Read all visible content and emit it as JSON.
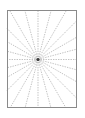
{
  "figure": {
    "type": "radial-line-diagram",
    "canvas": {
      "width": 85,
      "height": 118,
      "background_color": "#ffffff"
    },
    "frame": {
      "name": "bounding-rectangle",
      "x": 7,
      "y": 10,
      "width": 70,
      "height": 98,
      "stroke_color": "#8a8a8a",
      "stroke_width": 1,
      "fill": "none"
    },
    "hub": {
      "name": "convergence-point",
      "x": 38,
      "y": 59.5,
      "radius": 1.6,
      "color": "#3a3a3a",
      "label": "center"
    },
    "rays": {
      "count": 24,
      "angle_step_degrees": 15,
      "start_angle_degrees": 0,
      "stroke_color": "#9a9a9a",
      "stroke_width": 0.6,
      "dash_pattern": "1.4 1.1",
      "origin_x": 38,
      "origin_y": 59.5,
      "angles_degrees": [
        0,
        15,
        30,
        45,
        60,
        75,
        90,
        105,
        120,
        135,
        150,
        165,
        180,
        195,
        210,
        225,
        240,
        255,
        270,
        285,
        300,
        315,
        330,
        345
      ]
    }
  },
  "chart_data": {
    "type": "line",
    "subtitle": "",
    "xlabel": "",
    "ylabel": "",
    "grid": false,
    "legend": "none",
    "xlim": [
      7,
      77
    ],
    "ylim": [
      10,
      108
    ],
    "annotations": [],
    "series": [
      {
        "name": "ray-000",
        "angle_deg": 0,
        "x": [
          38,
          77.0
        ],
        "y": [
          59.5,
          59.5
        ]
      },
      {
        "name": "ray-015",
        "angle_deg": 15,
        "x": [
          38,
          77.0
        ],
        "y": [
          59.5,
          49.05
        ]
      },
      {
        "name": "ray-030",
        "angle_deg": 30,
        "x": [
          38,
          77.0
        ],
        "y": [
          59.5,
          36.98
        ]
      },
      {
        "name": "ray-045",
        "angle_deg": 45,
        "x": [
          38,
          77.0
        ],
        "y": [
          59.5,
          20.5
        ]
      },
      {
        "name": "ray-060",
        "angle_deg": 60,
        "x": [
          38,
          66.62
        ],
        "y": [
          59.5,
          10.0
        ]
      },
      {
        "name": "ray-075",
        "angle_deg": 75,
        "x": [
          38,
          51.28
        ],
        "y": [
          59.5,
          10.0
        ]
      },
      {
        "name": "ray-090",
        "angle_deg": 90,
        "x": [
          38,
          38.0
        ],
        "y": [
          59.5,
          10.0
        ]
      },
      {
        "name": "ray-105",
        "angle_deg": 105,
        "x": [
          38,
          24.72
        ],
        "y": [
          59.5,
          10.0
        ]
      },
      {
        "name": "ray-120",
        "angle_deg": 120,
        "x": [
          38,
          9.38
        ],
        "y": [
          59.5,
          10.0
        ]
      },
      {
        "name": "ray-135",
        "angle_deg": 135,
        "x": [
          38,
          7.0
        ],
        "y": [
          59.5,
          28.5
        ]
      },
      {
        "name": "ray-150",
        "angle_deg": 150,
        "x": [
          38,
          7.0
        ],
        "y": [
          59.5,
          41.6
        ]
      },
      {
        "name": "ray-165",
        "angle_deg": 165,
        "x": [
          38,
          7.0
        ],
        "y": [
          59.5,
          51.2
        ]
      },
      {
        "name": "ray-180",
        "angle_deg": 180,
        "x": [
          38,
          7.0
        ],
        "y": [
          59.5,
          59.5
        ]
      },
      {
        "name": "ray-195",
        "angle_deg": 195,
        "x": [
          38,
          7.0
        ],
        "y": [
          59.5,
          67.8
        ]
      },
      {
        "name": "ray-210",
        "angle_deg": 210,
        "x": [
          38,
          7.0
        ],
        "y": [
          59.5,
          77.4
        ]
      },
      {
        "name": "ray-225",
        "angle_deg": 225,
        "x": [
          38,
          7.0
        ],
        "y": [
          59.5,
          90.5
        ]
      },
      {
        "name": "ray-240",
        "angle_deg": 240,
        "x": [
          38,
          10.02
        ],
        "y": [
          59.5,
          108.0
        ]
      },
      {
        "name": "ray-255",
        "angle_deg": 255,
        "x": [
          38,
          25.01
        ],
        "y": [
          59.5,
          108.0
        ]
      },
      {
        "name": "ray-270",
        "angle_deg": 270,
        "x": [
          38,
          38.0
        ],
        "y": [
          59.5,
          108.0
        ]
      },
      {
        "name": "ray-285",
        "angle_deg": 285,
        "x": [
          38,
          50.99
        ],
        "y": [
          59.5,
          108.0
        ]
      },
      {
        "name": "ray-300",
        "angle_deg": 300,
        "x": [
          38,
          65.98
        ],
        "y": [
          59.5,
          108.0
        ]
      },
      {
        "name": "ray-315",
        "angle_deg": 315,
        "x": [
          38,
          77.0
        ],
        "y": [
          59.5,
          98.5
        ]
      },
      {
        "name": "ray-330",
        "angle_deg": 330,
        "x": [
          38,
          77.0
        ],
        "y": [
          59.5,
          82.0
        ]
      },
      {
        "name": "ray-345",
        "angle_deg": 345,
        "x": [
          38,
          77.0
        ],
        "y": [
          59.5,
          69.95
        ]
      }
    ]
  }
}
